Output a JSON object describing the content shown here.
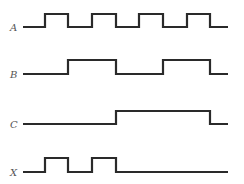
{
  "diagram": {
    "type": "timing-diagram",
    "x_start": 23,
    "x_end": 228,
    "edges_x": [
      23,
      45,
      68,
      92,
      116,
      139,
      163,
      187,
      210,
      228
    ],
    "signals": [
      {
        "name": "A",
        "label": "A",
        "base_y": 27,
        "high_y": 14,
        "levels": [
          0,
          1,
          0,
          1,
          0,
          1,
          0,
          1,
          0
        ]
      },
      {
        "name": "B",
        "label": "B",
        "base_y": 74,
        "high_y": 60,
        "levels": [
          0,
          0,
          1,
          1,
          0,
          0,
          1,
          1,
          0
        ]
      },
      {
        "name": "C",
        "label": "C",
        "base_y": 124,
        "high_y": 111,
        "levels": [
          0,
          0,
          0,
          0,
          1,
          1,
          1,
          1,
          0
        ]
      },
      {
        "name": "X",
        "label": "X",
        "base_y": 172,
        "high_y": 158,
        "levels": [
          0,
          1,
          0,
          1,
          0,
          0,
          0,
          0,
          0
        ]
      }
    ]
  }
}
